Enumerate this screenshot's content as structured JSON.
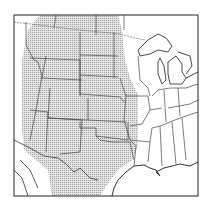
{
  "map": {
    "title": "",
    "region": "Central United States",
    "shaded_region": "Great Plains (stippled)",
    "colors": {
      "background": "#ffffff",
      "border": "#333333",
      "state_lines": "#444444",
      "stipple": "#9a9a9a",
      "stipple_bg": "#e2e2e2"
    }
  }
}
